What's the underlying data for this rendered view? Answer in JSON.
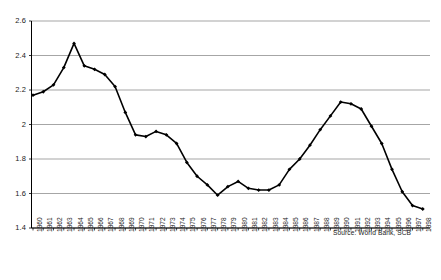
{
  "chart_data": {
    "type": "line",
    "title": "",
    "subtitle": "",
    "xlabel": "",
    "ylabel": "",
    "ylim": [
      1.4,
      2.6
    ],
    "ytick_step": 0.2,
    "yticks": [
      "1.4",
      "1.6",
      "1.8",
      "2",
      "2.2",
      "2.4",
      "2.6"
    ],
    "grid": true,
    "grid_axis": "y",
    "legend": false,
    "marker": "diamond",
    "line_color": "#000000",
    "grid_color": "#808080",
    "axis_color": "#000000",
    "annotation": "Source: World Bank, SCB",
    "categories": [
      "1960",
      "1961",
      "1962",
      "1963",
      "1964",
      "1965",
      "1966",
      "1967",
      "1968",
      "1969",
      "1970",
      "1971",
      "1972",
      "1973",
      "1974",
      "1975",
      "1976",
      "1977",
      "1978",
      "1979",
      "1980",
      "1981",
      "1982",
      "1983",
      "1984",
      "1985",
      "1986",
      "1987",
      "1988",
      "1989",
      "1990",
      "1991",
      "1992",
      "1993",
      "1994",
      "1995",
      "1996",
      "1997",
      "1998"
    ],
    "values": [
      2.17,
      2.19,
      2.23,
      2.33,
      2.47,
      2.34,
      2.32,
      2.29,
      2.22,
      2.07,
      1.94,
      1.93,
      1.96,
      1.94,
      1.89,
      1.78,
      1.7,
      1.65,
      1.59,
      1.64,
      1.67,
      1.63,
      1.62,
      1.62,
      1.65,
      1.74,
      1.8,
      1.88,
      1.97,
      2.05,
      2.13,
      2.12,
      2.09,
      1.99,
      1.89,
      1.74,
      1.61,
      1.53,
      1.51
    ]
  },
  "annotations": {
    "source": "Source: World Bank, SCB"
  }
}
